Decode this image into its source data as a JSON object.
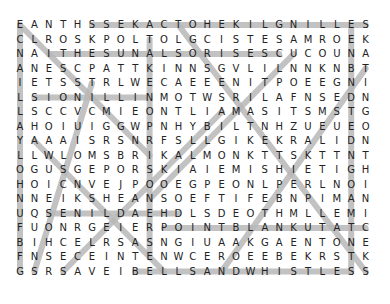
{
  "puzzle": {
    "type": "word-search",
    "rows": 18,
    "cols": 25,
    "grid": [
      "EANTHSSEKACTOHEKILGNILLES",
      "CLROSKPOLTOLGCISTESAMROEK",
      "NAITHESUNALSORISESCUCOUNA",
      "ANESCPATTKINNSGVLILNNKNBT",
      "IETSSTRLWECAEEENITPOEEGNI",
      "LSIONILLINMOTWSRILAFNSEDN",
      "LSCCVCMIEONTLIAMASITSMSTG",
      "AHOIUIGGWPNHYBILTNHZUEUEO",
      "YAAAISRSNRFSLLGIKEKRALIDN",
      "LLWLOMSBRIKALMONKTTSKTTNT",
      "OGUSGEPORSKIAIEMISHIETIGH",
      "HOICNVEJPOOEGPEONLPERLNOI",
      "NNEIKSHEANSOEFTIFEBNPIMAN",
      "UQSENILDAEHDLSDEOTHMLLEMI",
      "FUONRGEIERPOINTBLANKUTATC",
      "BIHCELRSASNGIUAAKGAENTONE",
      "FNSECEINTENWCEROEEBEKRSTK",
      "GSRSAVEIBELLSANDWHISTLESS"
    ],
    "highlight_color": "#b8b8b8",
    "letter_color": "#222222",
    "found_lines": [
      {
        "r1": 0,
        "c1": 5,
        "r2": 0,
        "c2": 24
      },
      {
        "r1": 2,
        "c1": 2,
        "r2": 2,
        "c2": 18
      },
      {
        "r1": 5,
        "c1": 1,
        "r2": 5,
        "c2": 9
      },
      {
        "r1": 13,
        "c1": 2,
        "r2": 13,
        "c2": 11
      },
      {
        "r1": 14,
        "c1": 10,
        "r2": 14,
        "c2": 24
      },
      {
        "r1": 17,
        "c1": 8,
        "r2": 17,
        "c2": 23
      },
      {
        "r1": 0,
        "c1": 0,
        "r2": 17,
        "c2": 0
      },
      {
        "r1": 0,
        "c1": 23,
        "r2": 17,
        "c2": 23
      },
      {
        "r1": 0,
        "c1": 0,
        "r2": 9,
        "c2": 9
      },
      {
        "r1": 0,
        "c1": 11,
        "r2": 17,
        "c2": 24
      },
      {
        "r1": 2,
        "c1": 19,
        "r2": 12,
        "c2": 9
      },
      {
        "r1": 3,
        "c1": 24,
        "r2": 17,
        "c2": 14
      },
      {
        "r1": 8,
        "c1": 1,
        "r2": 17,
        "c2": 10
      },
      {
        "r1": 4,
        "c1": 5,
        "r2": 17,
        "c2": 1
      },
      {
        "r1": 1,
        "c1": 9,
        "r2": 16,
        "c2": 9
      },
      {
        "r1": 6,
        "c1": 14,
        "r2": 17,
        "c2": 3
      }
    ]
  }
}
